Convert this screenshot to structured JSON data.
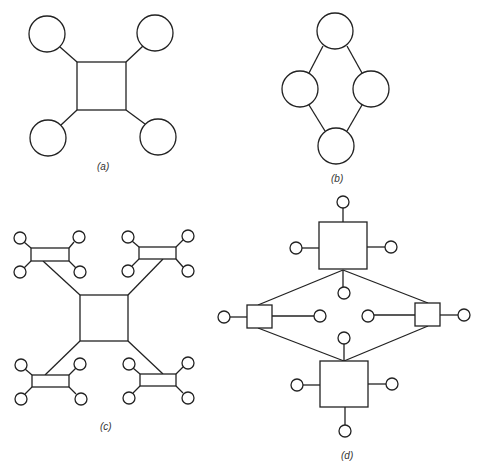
{
  "figure": {
    "panels": [
      {
        "id": "a",
        "caption": "(a)",
        "description": "Star: one square hub connected to four circular nodes"
      },
      {
        "id": "b",
        "caption": "(b)",
        "description": "Ring: four circular nodes connected in a diamond loop"
      },
      {
        "id": "c",
        "caption": "(c)",
        "description": "Hierarchical star: central square linked to four small rectangles, each with four circular nodes"
      },
      {
        "id": "d",
        "caption": "(d)",
        "description": "Mesh of four squares (two large, two small) in a diamond, each with attached circular nodes"
      }
    ],
    "colors": {
      "stroke": "#222222",
      "background": "#ffffff"
    }
  }
}
